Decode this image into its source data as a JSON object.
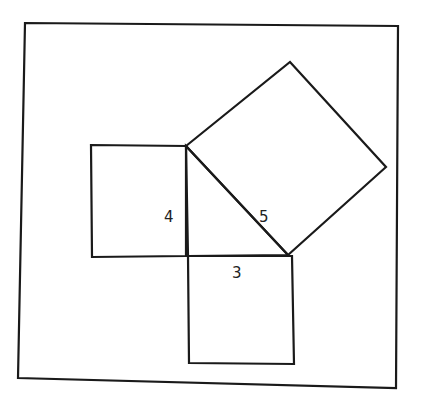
{
  "diagram": {
    "title": "",
    "colors": {
      "stroke": "#1a1a1a",
      "background": "#ffffff",
      "text": "#222222"
    },
    "frame": {
      "points": "25,23 398,26 396,388 18,378"
    },
    "shapes": {
      "square_side_4": {
        "points": "91,145 186,146 186,256 92,257"
      },
      "square_side_3": {
        "points": "188,256 292,256 294,364 189,363"
      },
      "square_hypotenuse_5": {
        "points": "186,146 290,62 386,167 288,255"
      },
      "triangle": {
        "points": "186,146 288,255 188,256"
      }
    },
    "labels": [
      {
        "id": "side-4-label",
        "text": "4",
        "x": 164,
        "y": 222
      },
      {
        "id": "side-5-label",
        "text": "5",
        "x": 259,
        "y": 222
      },
      {
        "id": "side-3-label",
        "text": "3",
        "x": 232,
        "y": 278
      }
    ]
  }
}
